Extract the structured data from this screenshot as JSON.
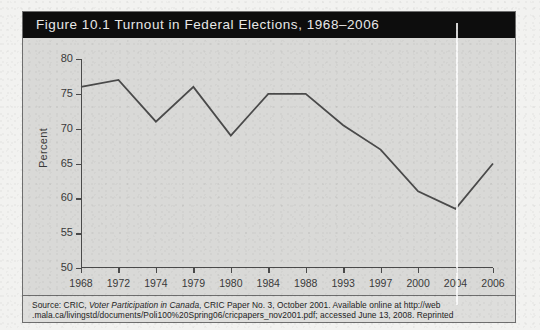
{
  "figure": {
    "title": "Figure 10.1    Turnout in Federal Elections, 1968–2006",
    "label": "Figure 10.1",
    "caption": "Turnout in Federal Elections, 1968–2006"
  },
  "source": {
    "line1_prefix": "Source: CRIC, ",
    "line1_italic": "Voter Participation in Canada",
    "line1_suffix": ", CRIC Paper No. 3, October 2001. Available online at http://web",
    "line2": ".mala.ca/livingstd/documents/Poli100%20Spring06/cricpapers_nov2001.pdf; accessed June 13, 2008. Reprinted"
  },
  "colors": {
    "title_bar": "#0d0d0d",
    "title_text": "#e8e8e8",
    "figure_bg": "#d9d9d7",
    "axis": "#4a4a4a",
    "series_line": "#4a4a4a",
    "page_bg": "#f2f2f0"
  },
  "chart_data": {
    "type": "line",
    "title": "Turnout in Federal Elections, 1968–2006",
    "xlabel": "",
    "ylabel": "Percent",
    "categories": [
      "1968",
      "1972",
      "1974",
      "1979",
      "1980",
      "1984",
      "1988",
      "1993",
      "1997",
      "2000",
      "2004",
      "2006"
    ],
    "values": [
      76,
      77,
      71,
      76,
      69,
      75,
      75,
      70.5,
      67,
      61,
      58.5,
      65
    ],
    "ylim": [
      50,
      80
    ],
    "yticks": [
      50,
      55,
      60,
      65,
      70,
      75,
      80
    ],
    "grid": false,
    "legend": false,
    "series": [
      {
        "name": "Turnout",
        "values": [
          76,
          77,
          71,
          76,
          69,
          75,
          75,
          70.5,
          67,
          61,
          58.5,
          65
        ]
      }
    ]
  }
}
